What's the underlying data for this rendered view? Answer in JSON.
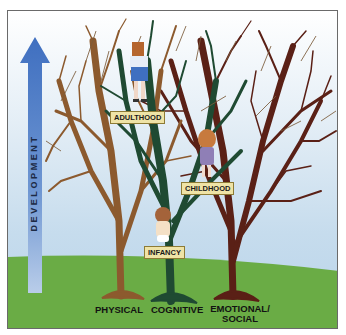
{
  "diagram": {
    "axis_label": "DEVELOPMENT",
    "stages": [
      {
        "label": "ADULTHOOD"
      },
      {
        "label": "CHILDHOOD"
      },
      {
        "label": "INFANCY"
      }
    ],
    "domains": [
      {
        "label": "PHYSICAL",
        "color": "#8c5a2e"
      },
      {
        "label": "COGNITIVE",
        "color": "#1f4a32"
      },
      {
        "label_line1": "EMOTIONAL/",
        "label_line2": "SOCIAL",
        "color": "#5a2016"
      }
    ],
    "colors": {
      "arrow": "#4f7fc7",
      "ground": "#6aac45",
      "label_bg": "#efe3a6"
    }
  }
}
